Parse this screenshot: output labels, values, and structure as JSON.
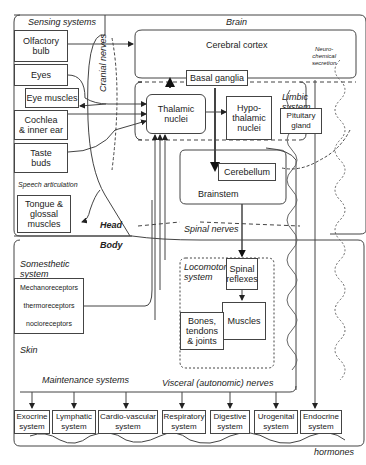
{
  "regions": {
    "sensing": "Sensing systems",
    "brain": "Brain",
    "head": "Head",
    "body": "Body",
    "limbic": "Limbic\nsystem",
    "speech": "Speech articulation",
    "somesthetic": "Somesthetic\nsystem",
    "skin": "Skin",
    "maintenance": "Maintenance systems",
    "locomotor": "Locomotor\nsystem"
  },
  "pathways": {
    "cranial_nerves": "Cranial nerves",
    "spinal_nerves": "Spinal nerves",
    "visceral_nerves": "Visceral (autonomic) nerves",
    "neurochemical": "Neuro-\nchemical\nsecretion",
    "hormones": "hormones"
  },
  "sensing_boxes": {
    "olfactory": "Olfactory\nbulb",
    "eyes": "Eyes",
    "eye_muscles": "Eye muscles",
    "cochlea": "Cochlea\n& inner ear",
    "taste": "Taste\nbuds",
    "tongue": "Tongue &\nglossal\nmuscles"
  },
  "brain_boxes": {
    "cortex": "Cerebral cortex",
    "basal_ganglia": "Basal ganglia",
    "thalamic": "Thalamic\nnuclei",
    "hypothalamic": "Hypo-\nthalamic\nnuclei",
    "pituitary": "Pituitary\ngland",
    "cerebellum": "Cerebellum",
    "brainstem": "Brainstem"
  },
  "receptors": [
    "Mechanoreceptors",
    "thermoreceptors",
    "nocioreceptors"
  ],
  "locomotor_boxes": {
    "spinal_reflexes": "Spinal\nreflexes",
    "muscles": "Muscles",
    "bones": "Bones,\ntendons\n& joints"
  },
  "maintenance_systems": [
    "Exocrine\nsystem",
    "Lymphatic\nsystem",
    "Cardio-vascular\nsystem",
    "Respiratory\nsystem",
    "Digestive\nsystem",
    "Urogenital\nsystem",
    "Endocrine\nsystem"
  ]
}
